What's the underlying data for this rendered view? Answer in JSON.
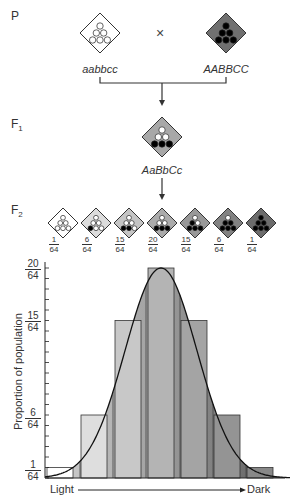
{
  "generations": {
    "p_label": "P",
    "f1_label": "F",
    "f1_sub": "1",
    "f2_label": "F",
    "f2_sub": "2"
  },
  "parents": {
    "left": {
      "genotype": "aabbcc",
      "fill": "#ffffff",
      "dots_dark": 0
    },
    "cross_symbol": "×",
    "right": {
      "genotype": "AABBCC",
      "fill": "#707070",
      "dots_dark": 6
    }
  },
  "f1": {
    "genotype": "AaBbCc",
    "fill": "#a8a8a8",
    "dots_dark": 3
  },
  "f2": [
    {
      "num": "1",
      "den": "64",
      "dots_dark": 0,
      "fill": "#ffffff"
    },
    {
      "num": "6",
      "den": "64",
      "dots_dark": 1,
      "fill": "#dcdcdc"
    },
    {
      "num": "15",
      "den": "64",
      "dots_dark": 2,
      "fill": "#c4c4c4"
    },
    {
      "num": "20",
      "den": "64",
      "dots_dark": 3,
      "fill": "#ababab"
    },
    {
      "num": "15",
      "den": "64",
      "dots_dark": 4,
      "fill": "#989898"
    },
    {
      "num": "6",
      "den": "64",
      "dots_dark": 5,
      "fill": "#828282"
    },
    {
      "num": "1",
      "den": "64",
      "dots_dark": 6,
      "fill": "#6c6c6c"
    }
  ],
  "chart_data": {
    "type": "bar",
    "title": "",
    "categories": [
      "0 dominant",
      "1 dominant",
      "2 dominant",
      "3 dominant",
      "4 dominant",
      "5 dominant",
      "6 dominant"
    ],
    "values": [
      1,
      6,
      15,
      20,
      15,
      6,
      1
    ],
    "value_denominator": 64,
    "xlabel_left": "Light",
    "xlabel_right": "Dark",
    "ylabel": "Proportion of population",
    "ytick_labels": [
      {
        "num": "1",
        "den": "64",
        "value": 1
      },
      {
        "num": "6",
        "den": "64",
        "value": 6
      },
      {
        "num": "15",
        "den": "64",
        "value": 15
      },
      {
        "num": "20",
        "den": "64",
        "value": 20
      }
    ],
    "ylim": [
      0,
      20
    ],
    "overlay": "normal distribution curve",
    "bar_fills": [
      "#ffffff",
      "#dedede",
      "#c8c8c8",
      "#b4b4b4",
      "#a4a4a4",
      "#949494",
      "#888888"
    ]
  }
}
